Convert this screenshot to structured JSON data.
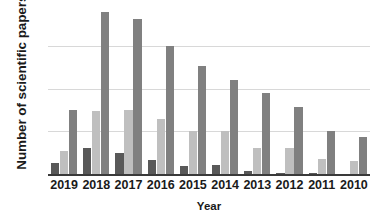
{
  "chart_data": {
    "type": "bar",
    "title": "",
    "xlabel": "Year",
    "ylabel": "Number of scientific papers",
    "categories": [
      "2019",
      "2018",
      "2017",
      "2016",
      "2015",
      "2014",
      "2013",
      "2012",
      "2011",
      "2010"
    ],
    "series": [
      {
        "name": "series-1-dark",
        "color": "#595959",
        "values": [
          0.25,
          0.62,
          0.5,
          0.33,
          0.2,
          0.21,
          0.08,
          0.02,
          0.03,
          0.0
        ]
      },
      {
        "name": "series-2-light",
        "color": "#bfbfbf",
        "values": [
          0.55,
          1.48,
          1.5,
          1.3,
          1.02,
          1.0,
          0.62,
          0.6,
          0.35,
          0.3
        ]
      },
      {
        "name": "series-3-medium",
        "color": "#808080",
        "values": [
          1.5,
          3.8,
          3.65,
          3.02,
          2.53,
          2.22,
          1.9,
          1.58,
          1.0,
          0.88
        ]
      }
    ],
    "ylim": [
      0,
      3.95
    ],
    "y_gridlines": [
      1,
      2,
      3
    ],
    "y_tick_labels": [],
    "grid": true,
    "legend": "none",
    "axis_line_color": "#3a3a3a",
    "gridline_color": "#d8d8d8",
    "background_color": "#ffffff"
  },
  "axes": {
    "y_title": "Number of scientific papers",
    "x_title": "Year"
  }
}
